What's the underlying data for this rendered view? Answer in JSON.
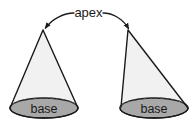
{
  "diagram": {
    "background_color": "#ffffff",
    "labels": {
      "apex": "apex",
      "base_left": "base",
      "base_right": "base"
    },
    "colors": {
      "outline": "#1a1a1a",
      "cone_body_fill": "#f1f1f1",
      "base_fill": "#a8a8a8",
      "hidden_edge": "#4d4d4d",
      "label_text": "#1a1a1a"
    },
    "shapes": [
      {
        "name": "cone-left",
        "type": "right-cone",
        "apex": {
          "x": 43,
          "y": 30
        },
        "base_center": {
          "x": 44,
          "y": 108
        },
        "base_radius_x": 34,
        "base_radius_y": 10,
        "base_label": "base"
      },
      {
        "name": "cone-right",
        "type": "oblique-cone",
        "apex": {
          "x": 128,
          "y": 30
        },
        "base_center": {
          "x": 154,
          "y": 108
        },
        "base_radius_x": 34,
        "base_radius_y": 10,
        "base_label": "base"
      }
    ],
    "annotations": [
      {
        "name": "apex-callout",
        "text": "apex",
        "text_position": {
          "x": 98,
          "y": 15
        },
        "arrows": [
          {
            "name": "apex-arrow-left",
            "points_to": {
              "x": 44,
              "y": 30
            }
          },
          {
            "name": "apex-arrow-right",
            "points_to": {
              "x": 128,
              "y": 31
            }
          }
        ]
      }
    ]
  }
}
